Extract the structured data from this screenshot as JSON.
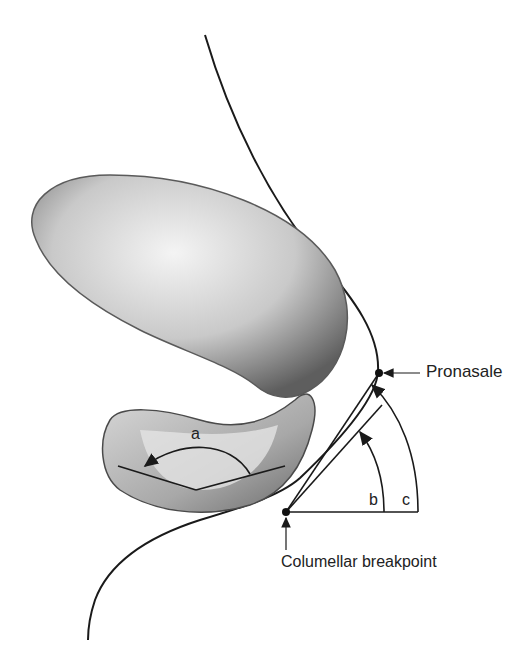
{
  "diagram": {
    "labels": {
      "pronasale": "Pronasale",
      "columellar_breakpoint": "Columellar breakpoint",
      "angle_a": "a",
      "angle_b": "b",
      "angle_c": "c"
    },
    "colors": {
      "line": "#1a1a1a",
      "background": "#ffffff",
      "shade_dark": "#6e6e6e",
      "shade_light": "#e8e8e8"
    }
  }
}
